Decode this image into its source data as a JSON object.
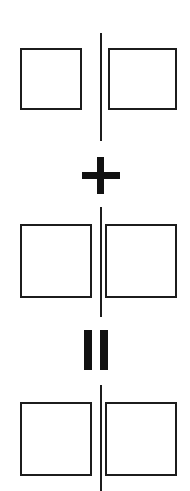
{
  "diagram": {
    "stroke_color": "#1c1c1c",
    "operator_color": "#111111",
    "background_color": "#ffffff",
    "rows": [
      {
        "name": "first-term",
        "left_square": {
          "label": "",
          "filled": false
        },
        "right_square": {
          "label": "",
          "filled": false
        },
        "divider": {
          "label": ""
        }
      },
      {
        "name": "second-term",
        "left_square": {
          "label": "",
          "filled": false
        },
        "right_square": {
          "label": "",
          "filled": false
        },
        "divider": {
          "label": ""
        }
      },
      {
        "name": "result-term",
        "left_square": {
          "label": "",
          "filled": false
        },
        "right_square": {
          "label": "",
          "filled": false
        },
        "divider": {
          "label": ""
        }
      }
    ],
    "operators": [
      {
        "name": "plus-operator",
        "symbol": "+",
        "between": "first-term and second-term"
      },
      {
        "name": "equals-operator",
        "symbol": "=",
        "between": "second-term and result-term"
      }
    ]
  }
}
